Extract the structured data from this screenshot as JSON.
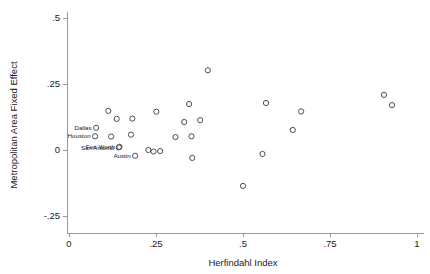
{
  "chart_data": {
    "type": "scatter",
    "title": "",
    "xlabel": "Herfindahl Index",
    "ylabel": "Metropolitan Area Fixed Effect",
    "xlim": [
      -0.02,
      1.03
    ],
    "ylim": [
      -0.29,
      0.52
    ],
    "xticks": [
      0,
      0.25,
      0.5,
      0.75,
      1
    ],
    "xticklabels": [
      "0",
      ".25",
      ".5",
      ".75",
      "1"
    ],
    "yticks": [
      -0.25,
      0,
      0.25,
      0.5
    ],
    "yticklabels": [
      "-.25",
      "0",
      ".25",
      ".5"
    ],
    "grid": false,
    "legend": null,
    "marker": "open-circle",
    "marker_color": "#4d4d56",
    "points": [
      {
        "x": 0.078,
        "y": 0.084,
        "label": "Dallas"
      },
      {
        "x": 0.075,
        "y": 0.052,
        "label": "Houston"
      },
      {
        "x": 0.143,
        "y": 0.01,
        "label": "San Antonio"
      },
      {
        "x": 0.145,
        "y": 0.012,
        "label": "Fort Worth"
      },
      {
        "x": 0.19,
        "y": -0.022,
        "label": "Austin"
      },
      {
        "x": 0.113,
        "y": 0.148,
        "label": ""
      },
      {
        "x": 0.137,
        "y": 0.118,
        "label": ""
      },
      {
        "x": 0.182,
        "y": 0.119,
        "label": ""
      },
      {
        "x": 0.121,
        "y": 0.051,
        "label": ""
      },
      {
        "x": 0.178,
        "y": 0.058,
        "label": ""
      },
      {
        "x": 0.228,
        "y": 0.0,
        "label": ""
      },
      {
        "x": 0.243,
        "y": -0.006,
        "label": ""
      },
      {
        "x": 0.262,
        "y": -0.004,
        "label": ""
      },
      {
        "x": 0.251,
        "y": 0.145,
        "label": ""
      },
      {
        "x": 0.306,
        "y": 0.049,
        "label": ""
      },
      {
        "x": 0.331,
        "y": 0.106,
        "label": ""
      },
      {
        "x": 0.345,
        "y": 0.174,
        "label": ""
      },
      {
        "x": 0.352,
        "y": 0.052,
        "label": ""
      },
      {
        "x": 0.354,
        "y": -0.03,
        "label": ""
      },
      {
        "x": 0.377,
        "y": 0.113,
        "label": ""
      },
      {
        "x": 0.399,
        "y": 0.302,
        "label": ""
      },
      {
        "x": 0.5,
        "y": -0.136,
        "label": ""
      },
      {
        "x": 0.556,
        "y": -0.015,
        "label": ""
      },
      {
        "x": 0.566,
        "y": 0.178,
        "label": ""
      },
      {
        "x": 0.643,
        "y": 0.076,
        "label": ""
      },
      {
        "x": 0.667,
        "y": 0.146,
        "label": ""
      },
      {
        "x": 0.905,
        "y": 0.209,
        "label": ""
      },
      {
        "x": 0.928,
        "y": 0.17,
        "label": ""
      }
    ]
  }
}
